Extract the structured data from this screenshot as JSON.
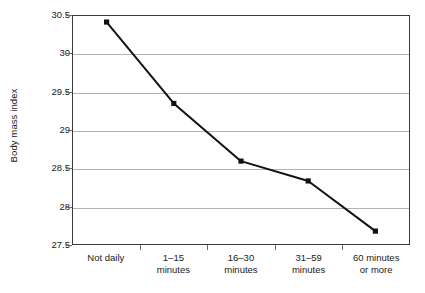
{
  "chart_data": {
    "type": "line",
    "title": "",
    "subtitle": "",
    "xlabel": "",
    "ylabel": "Body mass index",
    "categories": [
      "Not daily",
      "1–15 minutes",
      "16–30 minutes",
      "31–59 minutes",
      "60 minutes or more"
    ],
    "category_lines": [
      [
        "Not daily",
        ""
      ],
      [
        "1–15",
        "minutes"
      ],
      [
        "16–30",
        "minutes"
      ],
      [
        "31–59",
        "minutes"
      ],
      [
        "60 minutes",
        "or more"
      ]
    ],
    "values": [
      30.42,
      29.35,
      28.59,
      28.33,
      27.67
    ],
    "series": [
      {
        "name": "Body mass index",
        "values": [
          30.42,
          29.35,
          28.59,
          28.33,
          27.67
        ]
      }
    ],
    "ylim": [
      27.5,
      30.5
    ],
    "yticks": [
      30.5,
      30,
      29.5,
      29,
      28.5,
      28,
      27.5
    ],
    "ytick_labels": [
      "30.5",
      "30",
      "29.5",
      "29",
      "28.5",
      "28",
      "27.5"
    ],
    "grid": true,
    "grid_axis": "y",
    "legend": false,
    "legend_position": "none",
    "marker": "square",
    "line_color": "#111111",
    "marker_color": "#111111",
    "grid_color": "#b2b2b2",
    "frame_color": "#3a3a3a",
    "background_color": "#ffffff"
  }
}
